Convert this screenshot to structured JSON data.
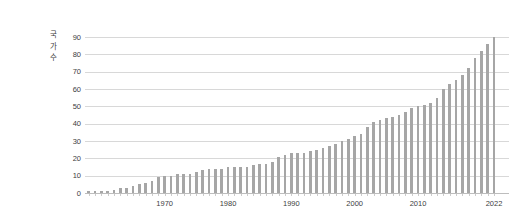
{
  "chart": {
    "y_axis_title": "국가수",
    "y_ticks": [
      0,
      10,
      20,
      30,
      40,
      50,
      60,
      70,
      80,
      90
    ],
    "x_tick_years": [
      "1970",
      "1980",
      "1990",
      "2000",
      "2010",
      "2022"
    ],
    "colors": {
      "bar": "#a6a6a6",
      "gridline": "#d8d8d8",
      "axis_line": "#bdbdbd",
      "text": "#404040",
      "background": "#ffffff"
    }
  },
  "chart_data": {
    "type": "bar",
    "title": "",
    "xlabel": "",
    "ylabel": "국가수",
    "ylim": [
      0,
      90
    ],
    "grid": true,
    "legend": "none",
    "categories": [
      "1958",
      "1959",
      "1960",
      "1961",
      "1962",
      "1963",
      "1964",
      "1965",
      "1966",
      "1967",
      "1968",
      "1969",
      "1970",
      "1971",
      "1972",
      "1973",
      "1974",
      "1975",
      "1976",
      "1977",
      "1978",
      "1979",
      "1980",
      "1981",
      "1982",
      "1983",
      "1984",
      "1985",
      "1986",
      "1987",
      "1988",
      "1989",
      "1990",
      "1991",
      "1992",
      "1993",
      "1994",
      "1995",
      "1996",
      "1997",
      "1998",
      "1999",
      "2000",
      "2001",
      "2002",
      "2003",
      "2004",
      "2005",
      "2006",
      "2007",
      "2008",
      "2009",
      "2010",
      "2011",
      "2012",
      "2013",
      "2014",
      "2015",
      "2016",
      "2017",
      "2018",
      "2019",
      "2020",
      "2021",
      "2022"
    ],
    "values": [
      1,
      1,
      1,
      1,
      2,
      3,
      3,
      4,
      5,
      6,
      7,
      9,
      10,
      10,
      11,
      11,
      11,
      12,
      13,
      14,
      14,
      14,
      15,
      15,
      15,
      15,
      16,
      17,
      17,
      18,
      21,
      22,
      23,
      23,
      23,
      24,
      25,
      26,
      27,
      28,
      30,
      31,
      33,
      34,
      38,
      41,
      42,
      43,
      44,
      45,
      47,
      49,
      50,
      51,
      52,
      55,
      60,
      63,
      65,
      68,
      72,
      78,
      82,
      86,
      90
    ]
  }
}
